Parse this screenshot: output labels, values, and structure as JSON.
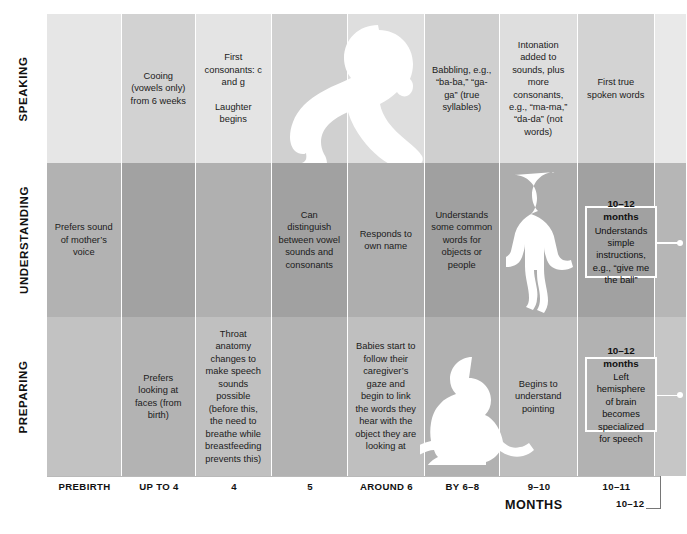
{
  "figure": {
    "axis_title": "MONTHS"
  },
  "rows": [
    {
      "id": "speaking",
      "label": "SPEAKING"
    },
    {
      "id": "understanding",
      "label": "UNDERSTANDING"
    },
    {
      "id": "preparing",
      "label": "PREPARING"
    }
  ],
  "columns": [
    {
      "id": "prebirth",
      "axis_label": "PREBIRTH"
    },
    {
      "id": "upto4",
      "axis_label": "UP TO 4"
    },
    {
      "id": "four",
      "axis_label": "4"
    },
    {
      "id": "five",
      "axis_label": "5"
    },
    {
      "id": "around6",
      "axis_label": "AROUND 6"
    },
    {
      "id": "by6to8",
      "axis_label": "BY 6–8"
    },
    {
      "id": "nine_ten",
      "axis_label": "9–10"
    },
    {
      "id": "ten_eleven",
      "axis_label": "10–11"
    },
    {
      "id": "ten_twelve",
      "axis_label": "10–12"
    }
  ],
  "cells": {
    "speaking": {
      "prebirth": "",
      "upto4": "Cooing (vowels only) from 6 weeks",
      "four": "First consonants: c and g\n\nLaughter begins",
      "five": "",
      "around6": "",
      "by6to8": "Babbling, e.g., “ba-ba,” “ga-ga” (true syllables)",
      "nine_ten": "Intonation added to sounds, plus more consonants, e.g., “ma-ma,” “da-da” (not words)",
      "ten_eleven": "First true spoken words",
      "ten_twelve": ""
    },
    "understanding": {
      "prebirth": "Prefers sound of mother’s voice",
      "upto4": "",
      "four": "",
      "five": "Can distinguish between vowel sounds and consonants",
      "around6": "Responds to own name",
      "by6to8": "Understands some common words for objects or people",
      "nine_ten": "",
      "ten_eleven": "",
      "ten_twelve": ""
    },
    "preparing": {
      "prebirth": "",
      "upto4": "Prefers looking at faces (from birth)",
      "four": "Throat anatomy changes to make speech sounds possible (before this, the need to breathe while breastfeeding prevents this)",
      "five": "",
      "around6": "Babies start to follow their caregiver’s gaze and begin to link the words they hear with the object they are looking at",
      "by6to8": "",
      "nine_ten": "Begins to understand pointing",
      "ten_eleven": "",
      "ten_twelve": ""
    }
  },
  "callouts": [
    {
      "id": "callout-understanding",
      "row": "understanding",
      "title": "10–12 months",
      "body": "Understands simple instructions, e.g., “give me the ball”"
    },
    {
      "id": "callout-preparing",
      "row": "preparing",
      "title": "10–12 months",
      "body": "Left hemisphere of brain becomes specialized for speech"
    }
  ],
  "silhouettes": [
    {
      "id": "crawling-baby",
      "row": "speaking",
      "name": "crawling-baby-silhouette"
    },
    {
      "id": "standing-baby",
      "row": "understanding",
      "name": "standing-baby-silhouette"
    },
    {
      "id": "sitting-baby",
      "row": "preparing",
      "name": "sitting-baby-silhouette"
    }
  ],
  "colors": {
    "band_speaking_light": "#e3e3e3",
    "band_speaking_dark": "#cfcfcf",
    "band_understanding_light": "#b4b4b4",
    "band_understanding_dark": "#a3a3a3",
    "band_preparing_light": "#c3c3c3",
    "band_preparing_dark": "#b3b3b3",
    "silhouette": "#ffffff",
    "text": "#1b1b1b",
    "axis": "#b9b9b9"
  }
}
